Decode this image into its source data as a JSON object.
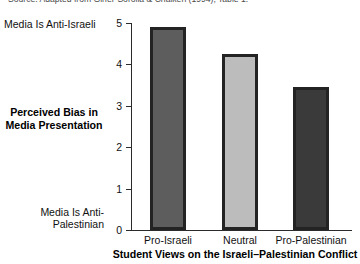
{
  "source_note": "Source: Adapted from Giner-Sorolla & Chaiken (1994), Table 1.",
  "axis": {
    "y_title_line1": "Perceived Bias in",
    "y_title_line2": "Media Presentation",
    "x_title": "Student Views on the Israeli–Palestinian Conflict",
    "anchor_top": "Media Is Anti-Israeli",
    "anchor_bottom_line1": "Media Is Anti-",
    "anchor_bottom_line2": "Palestinian",
    "ticks": [
      "0",
      "1",
      "2",
      "3",
      "4",
      "5"
    ]
  },
  "chart_data": {
    "type": "bar",
    "title": "",
    "subtitle": "",
    "categories": [
      "Pro-Israeli",
      "Neutral",
      "Pro-Palestinian"
    ],
    "values": [
      4.9,
      4.25,
      3.45
    ],
    "xlabel": "Student Views on the Israeli–Palestinian Conflict",
    "ylabel": "Perceived Bias in Media Presentation",
    "ylim": [
      0,
      5
    ],
    "yticks": [
      0,
      1,
      2,
      3,
      4,
      5
    ],
    "y_axis_low_anchor": "Media Is Anti-Palestinian",
    "y_axis_high_anchor": "Media Is Anti-Israeli",
    "grid": false,
    "legend": "none",
    "bar_colors": [
      "#5d5d5d",
      "#bcbcbc",
      "#3a3a3a"
    ],
    "bar_edge_color": "#232323",
    "annotations": [
      "Source: Adapted from Giner-Sorolla & Chaiken (1994), Table 1."
    ]
  }
}
